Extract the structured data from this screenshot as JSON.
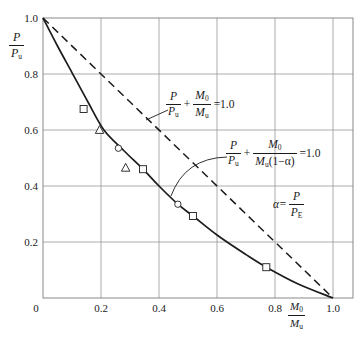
{
  "figure": {
    "background": "#ffffff",
    "curve_color": "#1c1c1c",
    "grid_color": "#909090",
    "text_color": "#1a1a1a"
  },
  "axes": {
    "x_ticks": [
      "0",
      "0.2",
      "0.4",
      "0.6",
      "0.8",
      "1.0"
    ],
    "y_ticks": [
      "0.2",
      "0.4",
      "0.6",
      "0.8",
      "1.0"
    ],
    "y_label": {
      "num": "P",
      "den": "P",
      "den_sub": "u"
    },
    "x_label": {
      "num": "M",
      "num_sub": "0",
      "den": "M",
      "den_sub": "u"
    }
  },
  "annotations": {
    "eq_linear": {
      "f1_num": "P",
      "f1_den": "P",
      "f1_den_sub": "u",
      "plus": "+",
      "f2_num": "M",
      "f2_num_sub": "0",
      "f2_den": "M",
      "f2_den_sub": "u",
      "rhs": "=1.0"
    },
    "eq_amplified": {
      "f1_num": "P",
      "f1_den": "P",
      "f1_den_sub": "u",
      "plus": "+",
      "f2_num": "M",
      "f2_num_sub": "0",
      "f2_den": "M",
      "f2_den_sub": "u",
      "f2_den_rest": "(1−α)",
      "rhs": "=1.0"
    },
    "alpha_def": {
      "lhs": "α=",
      "num": "P",
      "den": "P",
      "den_sub": "E"
    }
  },
  "chart_data": {
    "type": "line",
    "title": "",
    "xlabel": "M0/Mu",
    "ylabel": "P/Pu",
    "xlim": [
      0,
      1.0
    ],
    "ylim": [
      0,
      1.0
    ],
    "grid": true,
    "grid_step": 0.2,
    "legend_position": "none",
    "series": [
      {
        "name": "P/Pu + M0/Mu = 1.0 (linear interaction, dashed)",
        "style": "dashed",
        "points": [
          [
            0,
            1.0
          ],
          [
            1.0,
            0
          ]
        ]
      },
      {
        "name": "P/Pu + M0/(Mu(1-a)) = 1.0 (amplified-moment interaction, solid)",
        "style": "solid",
        "points": [
          [
            0,
            1.0
          ],
          [
            0.05,
            0.9
          ],
          [
            0.1,
            0.805
          ],
          [
            0.155,
            0.7
          ],
          [
            0.21,
            0.6
          ],
          [
            0.28,
            0.525
          ],
          [
            0.345,
            0.46
          ],
          [
            0.4,
            0.4
          ],
          [
            0.465,
            0.335
          ],
          [
            0.517,
            0.293
          ],
          [
            0.6,
            0.225
          ],
          [
            0.7,
            0.155
          ],
          [
            0.77,
            0.11
          ],
          [
            0.88,
            0.05
          ],
          [
            1.0,
            0
          ]
        ]
      }
    ],
    "scatter": [
      {
        "marker": "square",
        "points": [
          [
            0.14,
            0.675
          ],
          [
            0.345,
            0.46
          ],
          [
            0.517,
            0.293
          ],
          [
            0.77,
            0.11
          ]
        ]
      },
      {
        "marker": "triangle",
        "points": [
          [
            0.195,
            0.6
          ],
          [
            0.285,
            0.465
          ]
        ]
      },
      {
        "marker": "circle",
        "points": [
          [
            0.26,
            0.535
          ],
          [
            0.465,
            0.335
          ]
        ]
      }
    ]
  }
}
